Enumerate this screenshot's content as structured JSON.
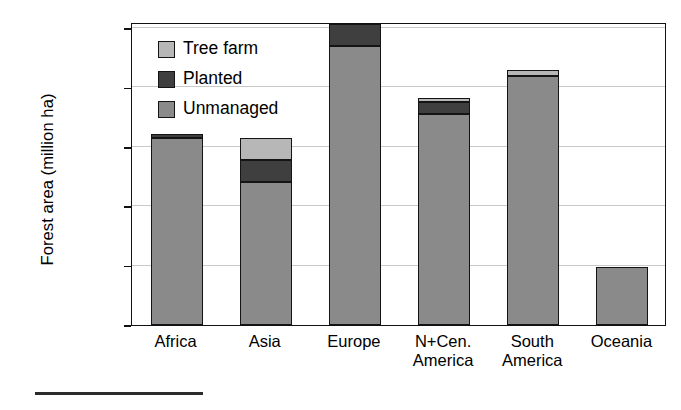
{
  "chart_data": {
    "type": "bar",
    "subtype": "stacked-vertical",
    "title": "",
    "xlabel": "",
    "ylabel": "Forest area (million ha)",
    "categories": [
      "Africa",
      "Asia",
      "Europe",
      "N+Cen. America",
      "South America",
      "Oceania"
    ],
    "category_lines": [
      [
        "Africa"
      ],
      [
        "Asia"
      ],
      [
        "Europe"
      ],
      [
        "N+Cen.",
        "America"
      ],
      [
        "South",
        "America"
      ],
      [
        "Oceania"
      ]
    ],
    "series": [
      {
        "name": "Unmanaged",
        "color": "#8a8a8a",
        "values": [
          630,
          480,
          940,
          710,
          838,
          195
        ]
      },
      {
        "name": "Planted",
        "color": "#3f3f3f",
        "values": [
          12,
          75,
          72,
          40,
          0,
          0
        ]
      },
      {
        "name": "Tree farm",
        "color": "#b7b7b7",
        "values": [
          0,
          75,
          0,
          15,
          20,
          0
        ]
      }
    ],
    "totals": [
      642,
      630,
      1012,
      765,
      858,
      195
    ],
    "ylim": [
      0,
      1020
    ],
    "yticks": [
      0,
      200,
      400,
      600,
      800,
      1000
    ],
    "ytick_labels": [
      "0",
      "200",
      "400",
      "600",
      "800",
      "1000"
    ],
    "grid": "horizontal",
    "legend_position": "inside-top-left",
    "legend_order": [
      "Tree farm",
      "Planted",
      "Unmanaged"
    ]
  },
  "legend": {
    "items": [
      {
        "label": "Tree farm",
        "key": "treefarm"
      },
      {
        "label": "Planted",
        "key": "planted"
      },
      {
        "label": "Unmanaged",
        "key": "unmanaged"
      }
    ]
  },
  "axis": {
    "y_title": "Forest area (million ha)"
  }
}
